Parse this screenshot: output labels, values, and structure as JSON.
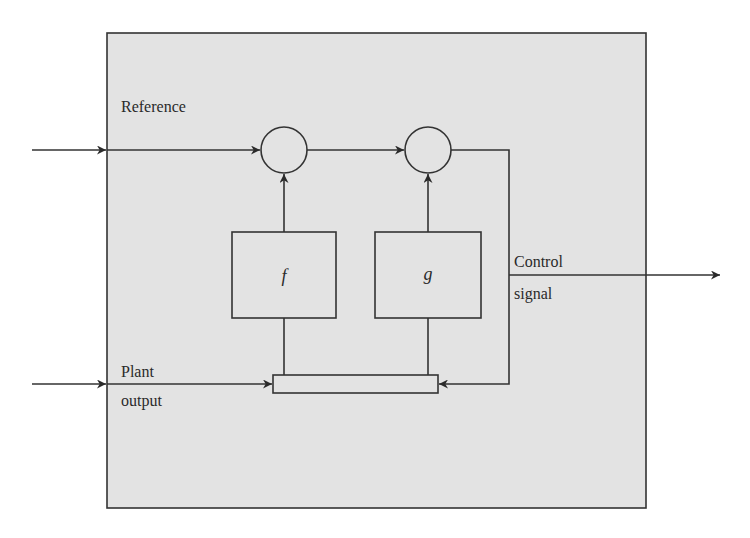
{
  "diagram": {
    "type": "block-diagram",
    "colors": {
      "background": "#ffffff",
      "panel_fill": "#e3e3e3",
      "stroke": "#333333",
      "text": "#2a2a2a"
    },
    "labels": {
      "reference": "Reference",
      "plant_output_line1": "Plant",
      "plant_output_line2": "output",
      "control_signal_line1": "Control",
      "control_signal_line2": "signal"
    },
    "blocks": [
      {
        "id": "f",
        "label": "f"
      },
      {
        "id": "g",
        "label": "g"
      }
    ],
    "summing_junctions": [
      {
        "id": "sum1"
      },
      {
        "id": "sum2"
      }
    ],
    "elements": {
      "memory_bar": "feedback bus bar"
    },
    "connections": [
      {
        "from": "external-reference",
        "to": "sum1"
      },
      {
        "from": "sum1",
        "to": "sum2"
      },
      {
        "from": "f",
        "to": "sum1"
      },
      {
        "from": "g",
        "to": "sum2"
      },
      {
        "from": "sum2",
        "to": "control-signal-output"
      },
      {
        "from": "sum2",
        "to": "bar"
      },
      {
        "from": "external-plant-output",
        "to": "bar"
      },
      {
        "from": "bar",
        "to": "f"
      },
      {
        "from": "bar",
        "to": "g"
      }
    ]
  }
}
